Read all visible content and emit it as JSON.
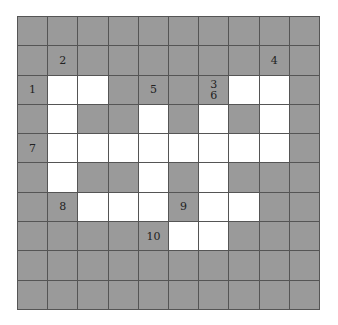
{
  "puzzle": {
    "rows": 10,
    "cols": 10,
    "colors": {
      "block": "#9a9a9a",
      "open": "#ffffff",
      "line": "#555555"
    },
    "grid": [
      "##########",
      "##########",
      "#..####..#",
      "#.##.#.#.#",
      "#........#",
      "#.##.#.###",
      "##...#..##",
      "#####..###",
      "##########",
      "##########"
    ],
    "labels": [
      {
        "row": 1,
        "col": 1,
        "text": "2"
      },
      {
        "row": 1,
        "col": 8,
        "text": "4"
      },
      {
        "row": 2,
        "col": 0,
        "text": "1"
      },
      {
        "row": 2,
        "col": 4,
        "text": "5"
      },
      {
        "row": 2,
        "col": 6,
        "text": "3\n6"
      },
      {
        "row": 4,
        "col": 0,
        "text": "7"
      },
      {
        "row": 6,
        "col": 1,
        "text": "8"
      },
      {
        "row": 6,
        "col": 5,
        "text": "9"
      },
      {
        "row": 7,
        "col": 4,
        "text": "10"
      }
    ]
  }
}
